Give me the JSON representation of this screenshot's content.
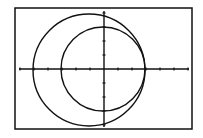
{
  "chart_data": {
    "type": "line",
    "title": "",
    "xlabel": "",
    "ylabel": "",
    "grid": false,
    "axes": {
      "x_ticks": 12,
      "y_ticks": 8
    },
    "series": [
      {
        "name": "large-circle",
        "shape": "circle",
        "cx": -1.75,
        "cy": 0,
        "r": 6.5
      },
      {
        "name": "small-circle",
        "shape": "circle",
        "cx": -0.2,
        "cy": 0,
        "r": 4.8
      }
    ],
    "colors": {
      "stroke": "#111111",
      "background": "#ffffff"
    }
  }
}
